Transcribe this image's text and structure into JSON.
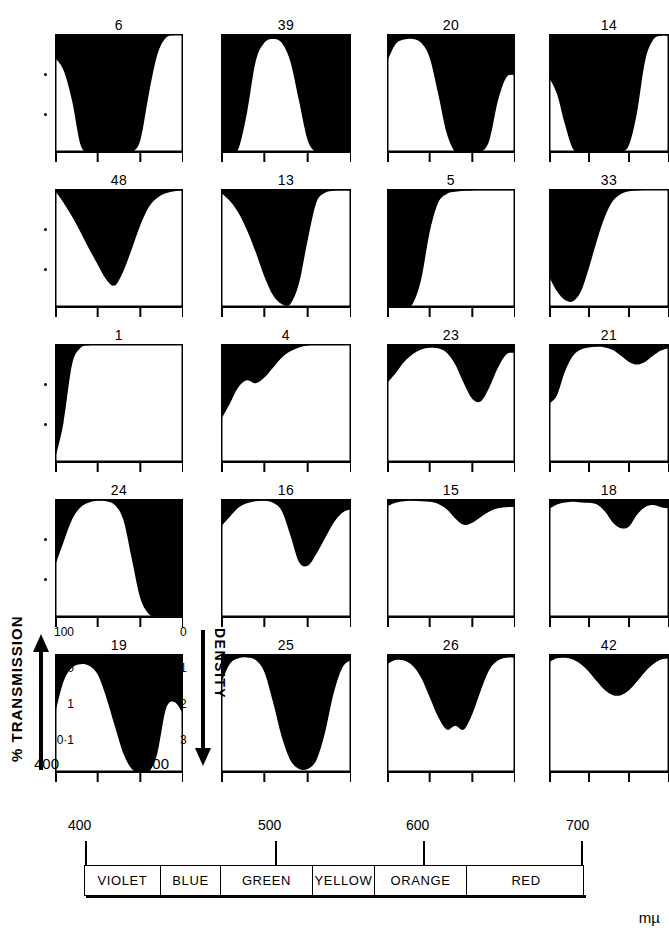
{
  "figure": {
    "axes": {
      "y_left_title": "% TRANSMISSION",
      "y_left_ticks": [
        "100",
        "10",
        "1",
        "0·1"
      ],
      "y_right_title": "DENSITY",
      "y_right_ticks": [
        "0",
        "1",
        "2",
        "3"
      ],
      "x_ticks": [
        "400",
        "700"
      ],
      "x_unit": "mµ"
    },
    "spectrum": {
      "scale_labels": [
        "400",
        "500",
        "600",
        "700"
      ],
      "unit": "mµ",
      "bands": [
        {
          "label": "VIOLET",
          "width": 76
        },
        {
          "label": "BLUE",
          "width": 60
        },
        {
          "label": "GREEN",
          "width": 92
        },
        {
          "label": "YELLOW",
          "width": 62
        },
        {
          "label": "ORANGE",
          "width": 92
        },
        {
          "label": "RED",
          "width": 118
        }
      ]
    }
  },
  "chart_data": {
    "type": "area",
    "xlabel": "mµ",
    "ylabel": "% TRANSMISSION",
    "ylabel_right": "DENSITY",
    "xlim": [
      400,
      700
    ],
    "ylim": [
      0.1,
      100
    ],
    "yscale": "log",
    "grid": false,
    "legend": "none",
    "x_tick_labels": [
      "400",
      "700"
    ],
    "y_tick_labels": [
      "100",
      "10",
      "1",
      "0·1"
    ],
    "y_right_tick_labels": [
      "0",
      "1",
      "2",
      "3"
    ],
    "note": "Each panel plots % transmission (white area, filled from baseline upward) against wavelength 400-700 mµ. Black region is the opaque/absorbed portion above the curve. y values below are % transmission sampled every 20 mµ from 400 to 700.",
    "series": [
      {
        "name": "6",
        "row": 1,
        "col": 1,
        "x": [
          400,
          420,
          440,
          460,
          480,
          500,
          520,
          540,
          560,
          580,
          600,
          620,
          640,
          660,
          680,
          700
        ],
        "values": [
          25,
          12,
          2,
          0.15,
          0.1,
          0.1,
          0.1,
          0.1,
          0.1,
          0.1,
          0.2,
          3,
          30,
          80,
          95,
          95
        ]
      },
      {
        "name": "39",
        "row": 1,
        "col": 2,
        "x": [
          400,
          420,
          440,
          460,
          480,
          500,
          520,
          540,
          560,
          580,
          600,
          620,
          640,
          660,
          680,
          700
        ],
        "values": [
          0.1,
          0.1,
          0.12,
          1,
          20,
          60,
          75,
          60,
          20,
          2,
          0.2,
          0.1,
          0.1,
          0.1,
          0.1,
          0.1
        ]
      },
      {
        "name": "20",
        "row": 1,
        "col": 3,
        "x": [
          400,
          420,
          440,
          460,
          480,
          500,
          520,
          540,
          560,
          580,
          600,
          620,
          640,
          660,
          680,
          700
        ],
        "values": [
          20,
          55,
          72,
          75,
          60,
          25,
          3,
          0.3,
          0.1,
          0.1,
          0.1,
          0.1,
          0.2,
          2,
          8,
          9
        ]
      },
      {
        "name": "14",
        "row": 1,
        "col": 4,
        "x": [
          400,
          420,
          440,
          460,
          480,
          500,
          520,
          540,
          560,
          580,
          600,
          620,
          640,
          660,
          680,
          700
        ],
        "values": [
          8,
          3,
          0.5,
          0.12,
          0.1,
          0.1,
          0.1,
          0.1,
          0.1,
          0.1,
          0.15,
          1,
          20,
          70,
          90,
          88
        ]
      },
      {
        "name": "48",
        "row": 2,
        "col": 1,
        "x": [
          400,
          420,
          440,
          460,
          480,
          500,
          520,
          540,
          560,
          580,
          600,
          620,
          640,
          660,
          680,
          700
        ],
        "values": [
          90,
          45,
          20,
          8,
          3,
          1.2,
          0.5,
          0.35,
          0.8,
          3,
          12,
          35,
          60,
          78,
          88,
          92
        ]
      },
      {
        "name": "13",
        "row": 2,
        "col": 2,
        "x": [
          400,
          420,
          440,
          460,
          480,
          500,
          520,
          540,
          560,
          580,
          600,
          620,
          640,
          660,
          680,
          700
        ],
        "values": [
          80,
          50,
          25,
          9,
          2.5,
          0.6,
          0.2,
          0.12,
          0.12,
          0.4,
          5,
          45,
          80,
          90,
          92,
          92
        ]
      },
      {
        "name": "5",
        "row": 2,
        "col": 3,
        "x": [
          400,
          420,
          440,
          460,
          480,
          500,
          520,
          540,
          560,
          580,
          600,
          620,
          640,
          660,
          680,
          700
        ],
        "values": [
          0.1,
          0.1,
          0.1,
          0.12,
          0.5,
          8,
          45,
          75,
          85,
          90,
          92,
          93,
          93,
          93,
          93,
          93
        ]
      },
      {
        "name": "33",
        "row": 2,
        "col": 4,
        "x": [
          400,
          420,
          440,
          460,
          480,
          500,
          520,
          540,
          560,
          580,
          600,
          620,
          640,
          660,
          680,
          700
        ],
        "values": [
          0.6,
          0.25,
          0.15,
          0.14,
          0.25,
          1,
          5,
          20,
          50,
          75,
          88,
          92,
          94,
          95,
          95,
          95
        ]
      },
      {
        "name": "1",
        "row": 3,
        "col": 1,
        "x": [
          400,
          420,
          440,
          460,
          480,
          500,
          520,
          540,
          560,
          580,
          600,
          620,
          640,
          660,
          680,
          700
        ],
        "values": [
          0.12,
          1,
          30,
          80,
          93,
          96,
          97,
          97,
          97,
          97,
          97,
          97,
          97,
          97,
          97,
          97
        ]
      },
      {
        "name": "4",
        "row": 3,
        "col": 2,
        "x": [
          400,
          420,
          440,
          460,
          480,
          500,
          520,
          540,
          560,
          580,
          600,
          620,
          640,
          660,
          680,
          700
        ],
        "values": [
          1.2,
          3,
          8,
          12,
          10,
          14,
          25,
          45,
          65,
          82,
          92,
          96,
          97,
          97,
          97,
          97
        ]
      },
      {
        "name": "23",
        "row": 3,
        "col": 3,
        "x": [
          400,
          420,
          440,
          460,
          480,
          500,
          520,
          540,
          560,
          580,
          600,
          620,
          640,
          660,
          680,
          700
        ],
        "values": [
          10,
          18,
          35,
          55,
          72,
          80,
          78,
          60,
          30,
          10,
          4,
          3.5,
          8,
          25,
          55,
          60
        ]
      },
      {
        "name": "21",
        "row": 3,
        "col": 4,
        "x": [
          400,
          420,
          440,
          460,
          480,
          500,
          520,
          540,
          560,
          580,
          600,
          620,
          640,
          660,
          680,
          700
        ],
        "values": [
          3,
          5,
          20,
          50,
          72,
          82,
          85,
          82,
          70,
          50,
          35,
          30,
          35,
          50,
          68,
          78
        ]
      },
      {
        "name": "24",
        "row": 4,
        "col": 1,
        "x": [
          400,
          420,
          440,
          460,
          480,
          500,
          520,
          540,
          560,
          580,
          600,
          620,
          640,
          660,
          680,
          700
        ],
        "values": [
          2,
          8,
          30,
          62,
          82,
          90,
          88,
          70,
          30,
          3,
          0.3,
          0.12,
          0.1,
          0.1,
          0.1,
          0.1
        ]
      },
      {
        "name": "16",
        "row": 4,
        "col": 2,
        "x": [
          400,
          420,
          440,
          460,
          480,
          500,
          520,
          540,
          560,
          580,
          600,
          620,
          640,
          660,
          680,
          700
        ],
        "values": [
          20,
          35,
          60,
          78,
          88,
          90,
          80,
          50,
          12,
          2.5,
          2,
          4,
          10,
          25,
          45,
          55
        ]
      },
      {
        "name": "15",
        "row": 4,
        "col": 3,
        "x": [
          400,
          420,
          440,
          460,
          480,
          500,
          520,
          540,
          560,
          580,
          600,
          620,
          640,
          660,
          680,
          700
        ],
        "values": [
          65,
          80,
          88,
          90,
          88,
          85,
          75,
          55,
          32,
          22,
          25,
          35,
          48,
          58,
          62,
          62
        ]
      },
      {
        "name": "18",
        "row": 4,
        "col": 4,
        "x": [
          400,
          420,
          440,
          460,
          480,
          500,
          520,
          540,
          560,
          580,
          600,
          620,
          640,
          660,
          680,
          700
        ],
        "values": [
          55,
          72,
          82,
          85,
          82,
          80,
          72,
          48,
          25,
          18,
          20,
          40,
          62,
          70,
          62,
          58
        ]
      },
      {
        "name": "19",
        "row": 5,
        "col": 1,
        "x": [
          400,
          420,
          440,
          460,
          480,
          500,
          520,
          540,
          560,
          580,
          600,
          620,
          640,
          660,
          680,
          700
        ],
        "values": [
          3,
          20,
          45,
          55,
          50,
          30,
          8,
          1.5,
          0.3,
          0.12,
          0.1,
          0.1,
          0.3,
          4,
          6,
          3
        ]
      },
      {
        "name": "25",
        "row": 5,
        "col": 2,
        "x": [
          400,
          420,
          440,
          460,
          480,
          500,
          520,
          540,
          560,
          580,
          600,
          620,
          640,
          660,
          680,
          700
        ],
        "values": [
          18,
          55,
          78,
          82,
          70,
          35,
          6,
          0.8,
          0.2,
          0.12,
          0.12,
          0.2,
          1,
          10,
          45,
          70
        ]
      },
      {
        "name": "26",
        "row": 5,
        "col": 3,
        "x": [
          400,
          420,
          440,
          460,
          480,
          500,
          520,
          540,
          560,
          580,
          600,
          620,
          640,
          660,
          680,
          700
        ],
        "values": [
          55,
          70,
          68,
          50,
          25,
          8,
          2.5,
          1.2,
          1.5,
          1.2,
          3,
          12,
          40,
          68,
          80,
          80
        ]
      },
      {
        "name": "42",
        "row": 5,
        "col": 4,
        "x": [
          400,
          420,
          440,
          460,
          480,
          500,
          520,
          540,
          560,
          580,
          600,
          620,
          640,
          660,
          680,
          700
        ],
        "values": [
          62,
          78,
          80,
          72,
          55,
          35,
          20,
          12,
          9,
          9,
          12,
          20,
          35,
          55,
          72,
          78
        ]
      }
    ]
  }
}
